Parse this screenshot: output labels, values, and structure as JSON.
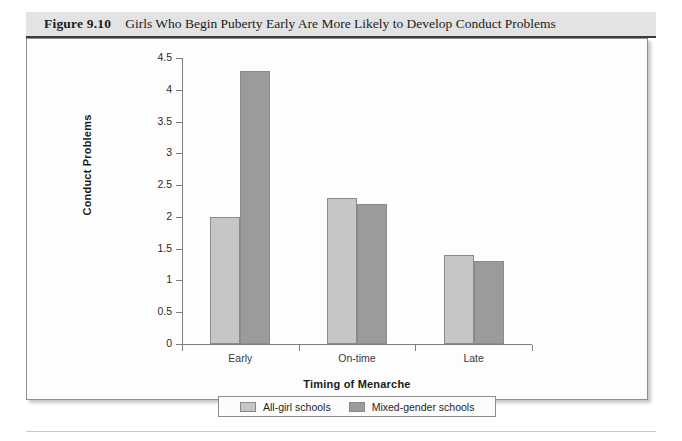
{
  "figure": {
    "number": "Figure 9.10",
    "title": "Girls Who Begin Puberty Early Are More Likely to Develop Conduct Problems"
  },
  "chart_data": {
    "type": "bar",
    "title": "Girls Who Begin Puberty Early Are More Likely to Develop Conduct Problems",
    "xlabel": "Timing of Menarche",
    "ylabel": "Conduct Problems",
    "categories": [
      "Early",
      "On-time",
      "Late"
    ],
    "series": [
      {
        "name": "All-girl schools",
        "color": "#c6c6c6",
        "values": [
          2.0,
          2.3,
          1.4
        ]
      },
      {
        "name": "Mixed-gender schools",
        "color": "#9b9b9b",
        "values": [
          4.3,
          2.2,
          1.3
        ]
      }
    ],
    "ylim": [
      0,
      4.5
    ],
    "ytick_labels": [
      "0",
      "0.5",
      "1",
      "1.5",
      "2",
      "2.5",
      "3",
      "3.5",
      "4",
      "4.5"
    ],
    "ytick_values": [
      0,
      0.5,
      1,
      1.5,
      2,
      2.5,
      3,
      3.5,
      4,
      4.5
    ],
    "grid": false,
    "legend_position": "bottom"
  }
}
